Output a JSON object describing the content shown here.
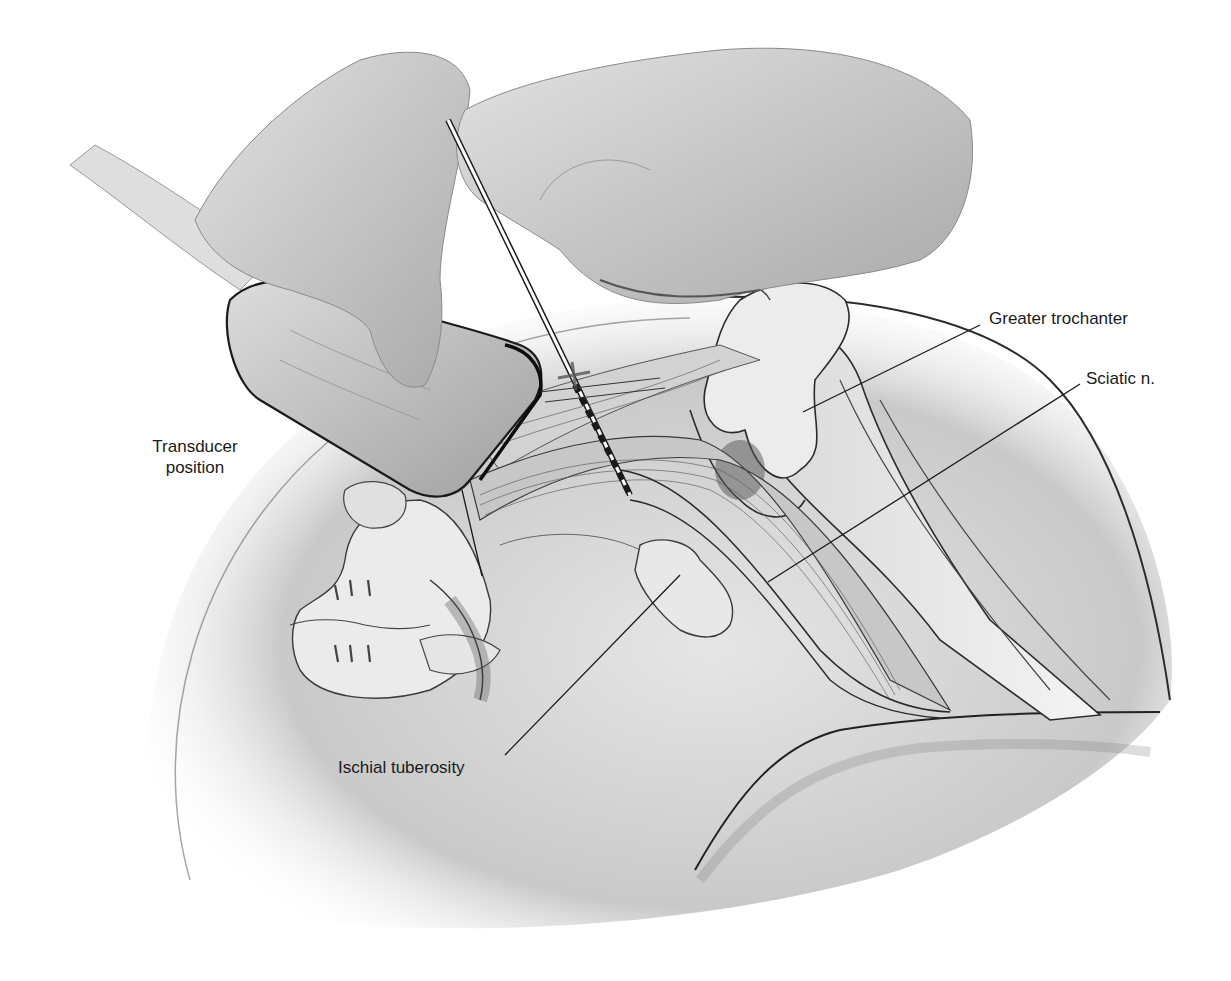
{
  "figure": {
    "style": "grayscale anatomical illustration"
  },
  "labels": {
    "transducer": {
      "line1": "Transducer",
      "line2": "position"
    },
    "greater_trochanter": "Greater trochanter",
    "sciatic": "Sciatic n.",
    "ischial": "Ischial tuberosity"
  },
  "structures": [
    "gloved-hand-holding-transducer",
    "gloved-hand-holding-needle",
    "ultrasound-transducer",
    "transducer-cable",
    "block-needle",
    "greater-trochanter",
    "femur",
    "sciatic-nerve",
    "ischial-tuberosity",
    "sacrum",
    "gluteal-outline",
    "thigh-outline"
  ],
  "colors": {
    "line": "#1a1a1a",
    "bone": "#e9e9e9",
    "muscle": "#cfcfcf",
    "shadow": "#8a8a8a",
    "glove": "#bdbdbd",
    "transducer": "#c6c6c6"
  }
}
